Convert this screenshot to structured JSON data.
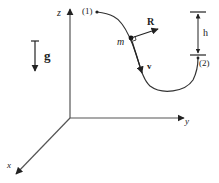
{
  "diagram": {
    "colors": {
      "ink": "#222222",
      "axis": "#555555",
      "background": "#ffffff"
    },
    "axes": {
      "z": {
        "label": "z"
      },
      "y": {
        "label": "y"
      },
      "x": {
        "label": "x"
      }
    },
    "gravity": {
      "label": "g"
    },
    "points": {
      "start": {
        "label": "(1)"
      },
      "end": {
        "label": "(2)"
      },
      "mass": {
        "label": "m"
      }
    },
    "vectors": {
      "reaction": {
        "label": "R"
      },
      "velocity": {
        "label": "v"
      }
    },
    "height": {
      "label": "h"
    }
  }
}
